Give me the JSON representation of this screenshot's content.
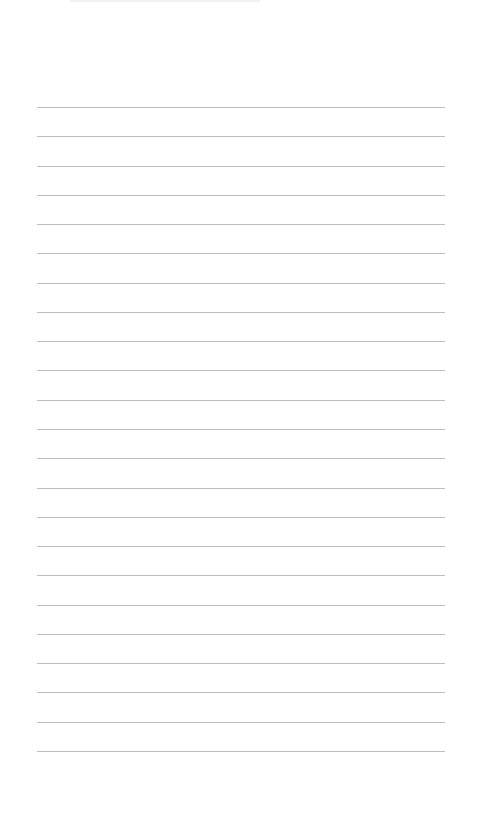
{
  "page": {
    "type": "blank lined paper",
    "background_color": "#ffffff",
    "line_color": "#bdbdbd",
    "line_count": 23,
    "first_line_y": 107,
    "line_spacing": 29.27,
    "line_left_x": 37,
    "line_right_x": 445,
    "text": ""
  }
}
